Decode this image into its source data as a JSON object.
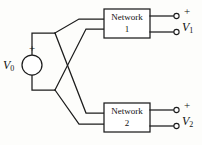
{
  "diagram": {
    "type": "circuit-schematic",
    "stroke_color": "#1c1c1c",
    "background_color": "#fdfdfb"
  },
  "source": {
    "label": "V",
    "subscript": "0",
    "polarity": "+",
    "symbol": "voltage-source-circle"
  },
  "networks": [
    {
      "id": "network-1",
      "label_line1": "Network",
      "label_line2": "1",
      "output": {
        "label": "V",
        "subscript": "1",
        "polarity": "+"
      }
    },
    {
      "id": "network-2",
      "label_line1": "Network",
      "label_line2": "2",
      "output": {
        "label": "V",
        "subscript": "2",
        "polarity": "+"
      }
    }
  ],
  "geometry": {
    "source_circle": {
      "cx": 32,
      "cy": 65,
      "r": 10
    },
    "source_plus": {
      "x": 32,
      "y": 48
    },
    "source_label": {
      "x": 4,
      "y": 66
    },
    "node_top": {
      "x": 55,
      "y": 33
    },
    "node_bottom": {
      "x": 55,
      "y": 90
    },
    "box1": {
      "x": 104,
      "y": 9,
      "w": 46,
      "h": 29
    },
    "box2": {
      "x": 104,
      "y": 103,
      "w": 46,
      "h": 29
    },
    "terminals": [
      {
        "cx": 177,
        "cy": 16
      },
      {
        "cx": 177,
        "cy": 32
      },
      {
        "cx": 177,
        "cy": 110
      },
      {
        "cx": 177,
        "cy": 126
      }
    ],
    "out_plus_1": {
      "x": 186,
      "y": 12
    },
    "out_label_1": {
      "x": 183,
      "y": 27
    },
    "out_plus_2": {
      "x": 186,
      "y": 106
    },
    "out_label_2": {
      "x": 183,
      "y": 121
    }
  }
}
